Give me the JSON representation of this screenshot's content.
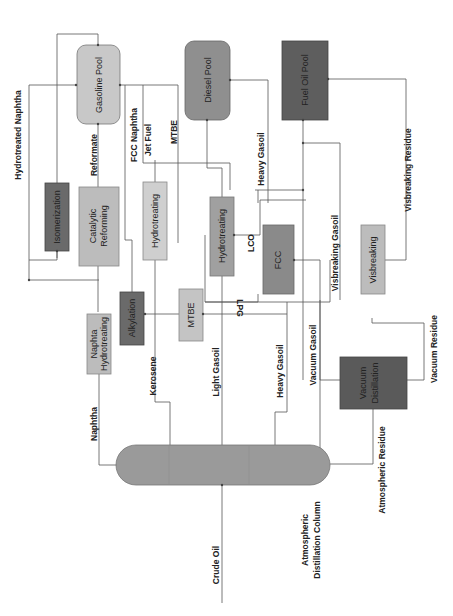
{
  "diagram": {
    "colors": {
      "light": "#c8c8c8",
      "medium": "#a5a5a5",
      "dark": "#6e6e6e",
      "darker": "#5a5a5a",
      "column": "#9a9a9a",
      "line": "#555555"
    },
    "nodes": {
      "gasoline_pool": "Gasoline Pool",
      "diesel_pool": "Diesel Pool",
      "fuel_oil_pool": "Fuel Oil Pool",
      "isomerization": "Isomerization",
      "catalytic_reforming_1": "Catalytic",
      "catalytic_reforming_2": "Reforming",
      "hydrotreating_kero": "Hydrotreating",
      "hydrotreating_lgo": "Hydrotreating",
      "alkylation": "Alkylation",
      "mtbe": "MTBE",
      "fcc": "FCC",
      "visbreaking": "Visbreaking",
      "naphta_ht_1": "Naphta",
      "naphta_ht_2": "Hydrotreating",
      "vacuum_1": "Vacuum",
      "vacuum_2": "Distillation",
      "column_1": "Atmospheric",
      "column_2": "Distillation Column"
    },
    "streams": {
      "hydrotreated_naphtha": "Hydrotreated Naphtha",
      "reformate": "Reformate",
      "fcc_naphtha": "FCC Naphtha",
      "jet_fuel": "Jet Fuel",
      "mtbe": "MTBE",
      "heavy_gasoil_top": "Heavy Gasoil",
      "visbreaking_residue": "Visbreaking Residue",
      "lco": "LCO",
      "lpg": "LPG",
      "visbreaking_gasoil": "Visbreaking Gasoil",
      "naphtha": "Naphtha",
      "kerosene": "Kerosene",
      "light_gasoil": "Light Gasoil",
      "heavy_gasoil": "Heavy Gasoil",
      "vacuum_gasoil": "Vacuum Gasoil",
      "vacuum_residue": "Vacuum Residue",
      "atmospheric_residue": "Atmospheric Residue",
      "crude_oil": "Crude Oil"
    }
  }
}
